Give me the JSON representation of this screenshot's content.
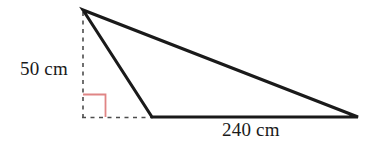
{
  "figure": {
    "background_color": "#ffffff",
    "stroke_color": "#1a1a1a",
    "dashed_color": "#4d4d4d",
    "right_angle_color": "#e08585",
    "labels": {
      "height": "50 cm",
      "base": "240 cm"
    },
    "geometry": {
      "apex": [
        83,
        10
      ],
      "base_left": [
        152,
        117
      ],
      "base_right": [
        358,
        117
      ],
      "foot_of_height": [
        83,
        117
      ],
      "right_angle_marker_size": 23
    },
    "measurements": [
      {
        "name": "height",
        "value": 50,
        "unit": "cm"
      },
      {
        "name": "base",
        "value": 240,
        "unit": "cm"
      }
    ]
  }
}
